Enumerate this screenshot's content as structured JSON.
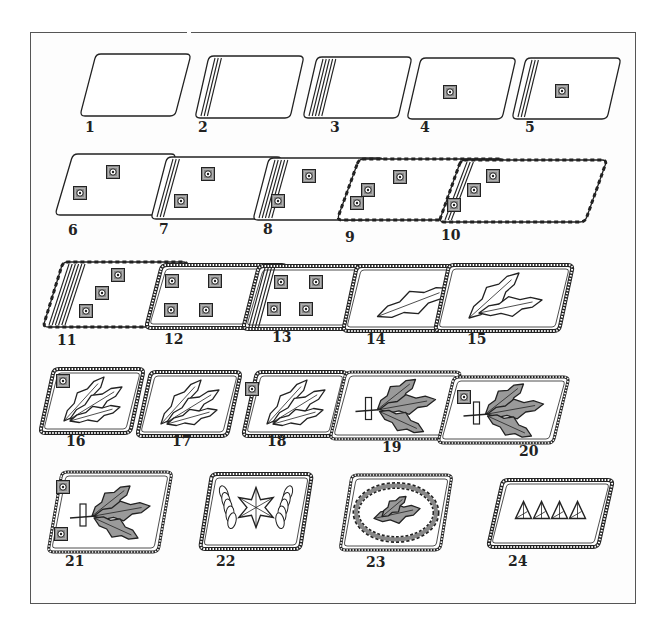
{
  "plate": {
    "description": "Collar insignia (collar patches) numbered 1 through 24",
    "frame_color": "#555555",
    "ink_color": "#222222"
  },
  "insignia": [
    {
      "n": "1",
      "x": 80,
      "y": 54,
      "w": 95,
      "h": 62,
      "skew": 16,
      "stripes": 0,
      "border": "plain",
      "pips": []
    },
    {
      "n": "2",
      "x": 195,
      "y": 56,
      "w": 95,
      "h": 62,
      "skew": 14,
      "stripes": 3,
      "border": "plain",
      "pips": []
    },
    {
      "n": "3",
      "x": 303,
      "y": 57,
      "w": 95,
      "h": 61,
      "skew": 14,
      "stripes": 5,
      "border": "plain",
      "pips": []
    },
    {
      "n": "4",
      "x": 407,
      "y": 58,
      "w": 95,
      "h": 61,
      "skew": 14,
      "stripes": 0,
      "border": "plain",
      "pips": [
        [
          450,
          92
        ]
      ]
    },
    {
      "n": "5",
      "x": 512,
      "y": 58,
      "w": 95,
      "h": 61,
      "skew": 14,
      "stripes": 3,
      "border": "plain",
      "pips": [
        [
          562,
          91
        ]
      ]
    },
    {
      "n": "6",
      "x": 55,
      "y": 154,
      "w": 103,
      "h": 61,
      "skew": 18,
      "stripes": 0,
      "border": "plain",
      "pips": [
        [
          113,
          172
        ],
        [
          80,
          193
        ]
      ]
    },
    {
      "n": "7",
      "x": 151,
      "y": 157,
      "w": 115,
      "h": 62,
      "skew": 16,
      "stripes": 3,
      "border": "plain",
      "pips": [
        [
          208,
          174
        ],
        [
          181,
          201
        ]
      ]
    },
    {
      "n": "8",
      "x": 253,
      "y": 158,
      "w": 115,
      "h": 62,
      "skew": 16,
      "stripes": 5,
      "border": "plain",
      "pips": [
        [
          309,
          176
        ],
        [
          278,
          201
        ]
      ]
    },
    {
      "n": "9",
      "x": 337,
      "y": 159,
      "w": 145,
      "h": 61,
      "skew": 22,
      "stripes": 0,
      "border": "dashed",
      "pips": [
        [
          400,
          177
        ],
        [
          368,
          190
        ],
        [
          357,
          203
        ]
      ]
    },
    {
      "n": "10",
      "x": 439,
      "y": 160,
      "w": 146,
      "h": 62,
      "skew": 22,
      "stripes": 3,
      "border": "dashed",
      "pips": [
        [
          493,
          176
        ],
        [
          474,
          190
        ],
        [
          454,
          205
        ]
      ]
    },
    {
      "n": "11",
      "x": 43,
      "y": 262,
      "w": 125,
      "h": 65,
      "skew": 20,
      "stripes": 6,
      "border": "dashed",
      "pips": [
        [
          118,
          275
        ],
        [
          102,
          293
        ],
        [
          86,
          311
        ]
      ]
    },
    {
      "n": "12",
      "x": 146,
      "y": 265,
      "w": 125,
      "h": 63,
      "skew": 16,
      "stripes": 0,
      "border": "rope",
      "pips": [
        [
          172,
          281
        ],
        [
          215,
          281
        ],
        [
          171,
          310
        ],
        [
          206,
          310
        ]
      ]
    },
    {
      "n": "13",
      "x": 243,
      "y": 266,
      "w": 125,
      "h": 63,
      "skew": 16,
      "stripes": 4,
      "border": "rope",
      "pips": [
        [
          281,
          282
        ],
        [
          316,
          282
        ],
        [
          274,
          309
        ],
        [
          306,
          309
        ]
      ]
    },
    {
      "n": "14",
      "x": 343,
      "y": 266,
      "w": 125,
      "h": 65,
      "skew": 14,
      "stripes": 0,
      "border": "rope",
      "pips": [],
      "emblem": "oak-branch"
    },
    {
      "n": "15",
      "x": 435,
      "y": 265,
      "w": 124,
      "h": 66,
      "skew": 14,
      "stripes": 0,
      "border": "rope",
      "pips": [],
      "emblem": "oak-branch-2"
    },
    {
      "n": "16",
      "x": 40,
      "y": 369,
      "w": 90,
      "h": 64,
      "skew": 14,
      "stripes": 0,
      "border": "rope",
      "pips": [
        [
          63,
          381
        ]
      ],
      "emblem": "oak-branch-3"
    },
    {
      "n": "17",
      "x": 137,
      "y": 372,
      "w": 90,
      "h": 64,
      "skew": 14,
      "stripes": 0,
      "border": "rope",
      "pips": [],
      "emblem": "oak-branch-3"
    },
    {
      "n": "18",
      "x": 243,
      "y": 372,
      "w": 90,
      "h": 64,
      "skew": 14,
      "stripes": 0,
      "border": "rope",
      "pips": [
        [
          252,
          389
        ]
      ],
      "emblem": "oak-branch-3"
    },
    {
      "n": "19",
      "x": 330,
      "y": 372,
      "w": 115,
      "h": 67,
      "skew": 16,
      "stripes": 0,
      "border": "rope-thin",
      "pips": [],
      "emblem": "oak-wreath-sword"
    },
    {
      "n": "20",
      "x": 438,
      "y": 377,
      "w": 115,
      "h": 66,
      "skew": 16,
      "stripes": 0,
      "border": "rope-thin",
      "pips": [
        [
          464,
          397
        ]
      ],
      "emblem": "oak-wreath-sword"
    },
    {
      "n": "21",
      "x": 48,
      "y": 472,
      "w": 110,
      "h": 80,
      "skew": 14,
      "stripes": 0,
      "border": "rope-thin",
      "pips": [
        [
          63,
          487
        ],
        [
          61,
          534
        ]
      ],
      "emblem": "oak-wreath-sword"
    },
    {
      "n": "22",
      "x": 200,
      "y": 474,
      "w": 100,
      "h": 75,
      "skew": 12,
      "stripes": 0,
      "border": "rope",
      "pips": [],
      "emblem": "star-wreath"
    },
    {
      "n": "23",
      "x": 340,
      "y": 475,
      "w": 100,
      "h": 75,
      "skew": 12,
      "stripes": 0,
      "border": "rope-thin",
      "pips": [],
      "emblem": "oak-oval-wreath"
    },
    {
      "n": "24",
      "x": 488,
      "y": 480,
      "w": 110,
      "h": 67,
      "skew": 15,
      "stripes": 0,
      "border": "rope",
      "pips": [],
      "emblem": "four-triangles"
    }
  ],
  "labels": [
    {
      "n": "1",
      "x": 85,
      "y": 126
    },
    {
      "n": "2",
      "x": 198,
      "y": 126
    },
    {
      "n": "3",
      "x": 330,
      "y": 126
    },
    {
      "n": "4",
      "x": 420,
      "y": 126
    },
    {
      "n": "5",
      "x": 525,
      "y": 126
    },
    {
      "n": "6",
      "x": 68,
      "y": 229
    },
    {
      "n": "7",
      "x": 159,
      "y": 228
    },
    {
      "n": "8",
      "x": 263,
      "y": 228
    },
    {
      "n": "9",
      "x": 345,
      "y": 236
    },
    {
      "n": "10",
      "x": 441,
      "y": 234
    },
    {
      "n": "11",
      "x": 57,
      "y": 339
    },
    {
      "n": "12",
      "x": 164,
      "y": 338
    },
    {
      "n": "13",
      "x": 272,
      "y": 336
    },
    {
      "n": "14",
      "x": 366,
      "y": 338
    },
    {
      "n": "15",
      "x": 467,
      "y": 338
    },
    {
      "n": "16",
      "x": 66,
      "y": 440
    },
    {
      "n": "17",
      "x": 172,
      "y": 440
    },
    {
      "n": "18",
      "x": 267,
      "y": 440
    },
    {
      "n": "19",
      "x": 382,
      "y": 446
    },
    {
      "n": "20",
      "x": 519,
      "y": 450
    },
    {
      "n": "21",
      "x": 65,
      "y": 560
    },
    {
      "n": "22",
      "x": 216,
      "y": 560
    },
    {
      "n": "23",
      "x": 366,
      "y": 561
    },
    {
      "n": "24",
      "x": 508,
      "y": 560
    }
  ]
}
